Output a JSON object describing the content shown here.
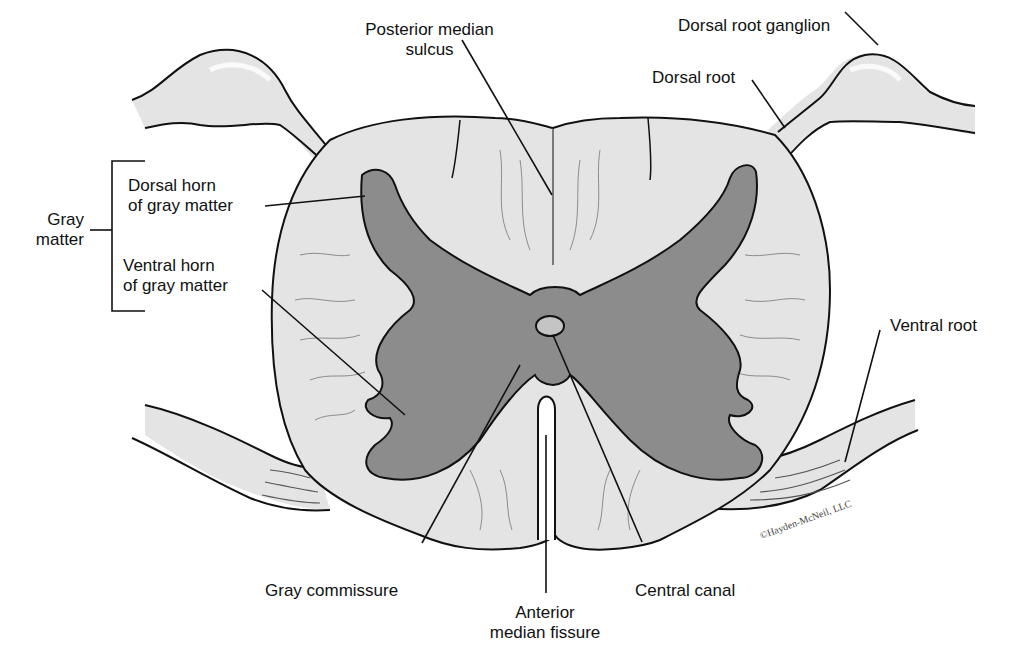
{
  "diagram": {
    "colors": {
      "white_matter": "#e4e4e4",
      "gray_matter": "#8c8c8c",
      "outline": "#111111",
      "background": "#ffffff"
    },
    "labels": {
      "posterior_median_sulcus": [
        "Posterior median",
        "sulcus"
      ],
      "dorsal_root_ganglion": "Dorsal root ganglion",
      "dorsal_root": "Dorsal root",
      "gray_matter": [
        "Gray",
        "matter"
      ],
      "dorsal_horn": [
        "Dorsal horn",
        "of gray matter"
      ],
      "ventral_horn": [
        "Ventral horn",
        "of gray matter"
      ],
      "ventral_root": "Ventral root",
      "gray_commissure": "Gray commissure",
      "anterior_median_fissure": [
        "Anterior",
        "median fissure"
      ],
      "central_canal": "Central canal"
    },
    "copyright": "©Hayden-McNeil, LLC"
  }
}
